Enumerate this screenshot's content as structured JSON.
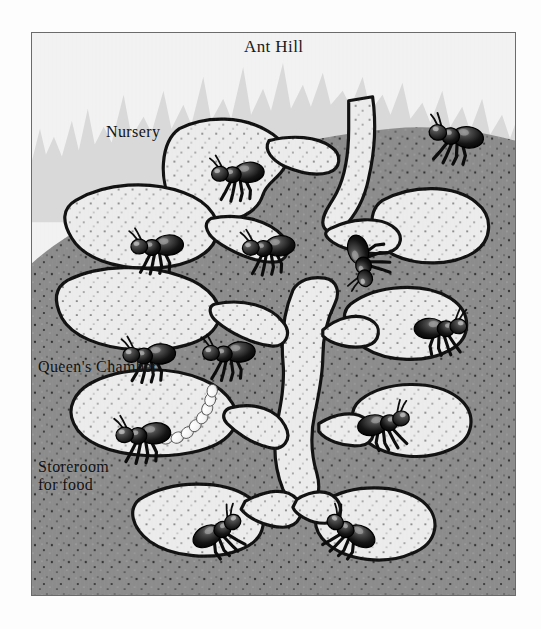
{
  "figure": {
    "labels": {
      "ant_hill": "Ant Hill",
      "nursery": "Nursery",
      "queens_chamber": "Queen's Chamber",
      "storeroom": "Storeroom\nfor food"
    },
    "colors": {
      "sky": "#f2f2f2",
      "grass": "#d8d8d8",
      "soil": "#8c8c8c",
      "soil_speckle": "#2b2b2b",
      "chamber_fill": "#ececec",
      "chamber_outline": "#111111",
      "ant_body": "#161616",
      "ant_highlight": "#8e8e8e",
      "egg": "#fbfbfb",
      "frame_border": "#6b6b6b",
      "page_background": "#ffffff",
      "label_text": "#111111"
    },
    "counts": {
      "ants": 12,
      "chambers": 10,
      "eggs": 9
    }
  }
}
